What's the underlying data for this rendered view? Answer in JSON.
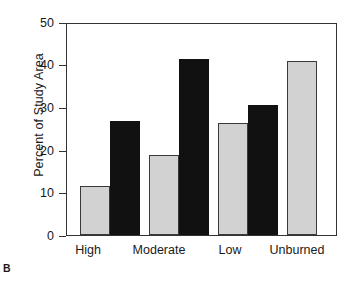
{
  "panel": {
    "letter": "B"
  },
  "chart_data": {
    "type": "bar",
    "title": "",
    "xlabel": "",
    "ylabel": "Percent of Study Area",
    "categories": [
      "High",
      "Moderate",
      "Low",
      "Unburned"
    ],
    "series": [
      {
        "name": "gray",
        "color": "#d2d2d2",
        "values": [
          11.5,
          18.7,
          26.3,
          40.8
        ]
      },
      {
        "name": "black",
        "color": "#111111",
        "values": [
          26.7,
          41.3,
          30.5,
          null
        ]
      }
    ],
    "ylim": [
      0,
      50
    ],
    "yticks": [
      0,
      10,
      20,
      30,
      40,
      50
    ],
    "ytick_labels": [
      "0",
      "10",
      "20",
      "30",
      "40",
      "50"
    ],
    "grid": false,
    "legend": "none"
  },
  "axis": {
    "y_title": "Percent of Study Area",
    "tick_0": "0",
    "tick_10": "10",
    "tick_20": "20",
    "tick_30": "30",
    "tick_40": "40",
    "tick_50": "50"
  },
  "xlabels": {
    "high": "High",
    "moderate": "Moderate",
    "low": "Low",
    "unburned": "Unburned"
  },
  "colors": {
    "bar_gray": "#d2d2d2",
    "bar_black": "#111111",
    "axis": "#333333",
    "background": "#ffffff"
  }
}
